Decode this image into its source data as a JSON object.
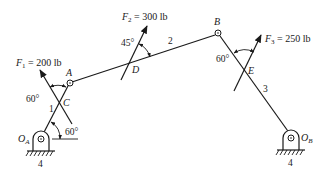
{
  "diagram": {
    "type": "four-bar linkage free body / force analysis",
    "forces": {
      "F1": {
        "symbol": "F",
        "sub": "1",
        "value": " = 200 lb",
        "point": "C",
        "angle_label": "60°"
      },
      "F2": {
        "symbol": "F",
        "sub": "2",
        "value": " = 300 lb",
        "point": "D",
        "angle_label": "45°"
      },
      "F3": {
        "symbol": "F",
        "sub": "3",
        "value": " = 250 lb",
        "point": "E",
        "angle_label": "60°"
      }
    },
    "points": {
      "A": "A",
      "B": "B",
      "C": "C",
      "D": "D",
      "E": "E"
    },
    "links": {
      "link1": "1",
      "link2": "2",
      "link3": "3",
      "ground_left": "4",
      "ground_right": "4"
    },
    "pivots": {
      "OA": {
        "symbol": "O",
        "sub": "A"
      },
      "OB": {
        "symbol": "O",
        "sub": "B"
      }
    },
    "crank_angle_label": "60°",
    "colors": {
      "ink": "#1a1a1a",
      "background": "#ffffff"
    }
  }
}
